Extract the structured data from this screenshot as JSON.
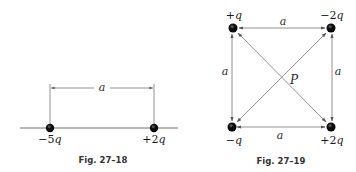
{
  "figures": [
    {
      "id": "fig-27-18",
      "caption": "Fig. 27–18",
      "distance_label": "a",
      "charges": [
        {
          "sign": "−",
          "coef": "5",
          "sym": "q",
          "label": "−5q"
        },
        {
          "sign": "+",
          "coef": "2",
          "sym": "q",
          "label": "+2q"
        }
      ]
    },
    {
      "id": "fig-27-19",
      "caption": "Fig. 27–19",
      "point_label": "P",
      "side_labels": {
        "top": "a",
        "left": "a",
        "right": "a",
        "bottom": "a"
      },
      "charges": {
        "top_left": {
          "sign": "+",
          "coef": "",
          "sym": "q",
          "label": "+q"
        },
        "top_right": {
          "sign": "−",
          "coef": "2",
          "sym": "q",
          "label": "−2q"
        },
        "bottom_left": {
          "sign": "−",
          "coef": "",
          "sym": "q",
          "label": "−q"
        },
        "bottom_right": {
          "sign": "+",
          "coef": "2",
          "sym": "q",
          "label": "+2q"
        }
      }
    }
  ],
  "colors": {
    "ink": "#1a1a1a",
    "line": "#6e6e6e",
    "arrow": "#555555"
  }
}
